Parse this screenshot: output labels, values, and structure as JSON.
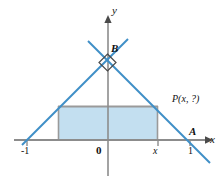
{
  "figure": {
    "kind": "coordinate-geometry-diagram",
    "axes": {
      "x_axis_label": "x",
      "y_axis_label": "y",
      "origin_label": "0"
    },
    "tick_labels": {
      "left": "-1",
      "origin": "0",
      "variable": "x",
      "right": "1"
    },
    "points": [
      {
        "id": "B",
        "label": "B",
        "note": "apex on y-axis, right angle"
      },
      {
        "id": "A",
        "label": "A",
        "note": "vertex at x = 1 on x-axis"
      },
      {
        "id": "P",
        "label": "P(x, ?)",
        "note": "point on right leg above x"
      }
    ],
    "right_angle_marker": {
      "at": "B",
      "shape": "square"
    },
    "shaded_rectangle": {
      "fill_label": "inscribed rectangle",
      "left_tick": "-x",
      "right_tick": "x"
    },
    "colors": {
      "line_blue": "#3f8fc7",
      "fill_blue": "#c3dff0",
      "axis_gray": "#8c8c8c",
      "rect_border": "#9a9a9a",
      "text": "#111111"
    }
  }
}
